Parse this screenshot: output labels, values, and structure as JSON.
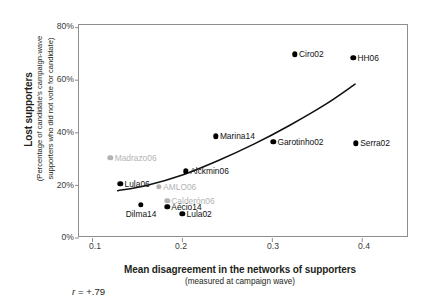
{
  "chart_data": {
    "type": "scatter",
    "title": "",
    "xlabel": "Mean disagreement in the networks of supporters",
    "xlabel_sub": "(measured at campaign wave)",
    "ylabel": "Lost supporters",
    "ylabel_sub_line1": "(Percentage of candidate's campaign-wave",
    "ylabel_sub_line2": "supporters who did not vote for candidate)",
    "xlim": [
      0.085,
      0.452
    ],
    "ylim": [
      0,
      81
    ],
    "xticks": [
      0.1,
      0.2,
      0.3,
      0.4
    ],
    "xtick_labels": [
      "0.1",
      "0.2",
      "0.3",
      "0.4"
    ],
    "yticks": [
      0,
      20,
      40,
      60,
      80
    ],
    "ytick_labels": [
      "0%",
      "20%",
      "40%",
      "60%",
      "80%"
    ],
    "grid": false,
    "legend": "none",
    "annotation": "r = +.79",
    "annotation_r": "r",
    "annotation_value": "= +.79",
    "trendline": {
      "type": "curve",
      "description": "fitted increasing curve",
      "points": [
        {
          "x": 0.128,
          "y": 18.0
        },
        {
          "x": 0.16,
          "y": 20.0
        },
        {
          "x": 0.2,
          "y": 24.0
        },
        {
          "x": 0.24,
          "y": 29.5
        },
        {
          "x": 0.28,
          "y": 35.8
        },
        {
          "x": 0.32,
          "y": 43.0
        },
        {
          "x": 0.36,
          "y": 51.0
        },
        {
          "x": 0.392,
          "y": 58.5
        }
      ]
    },
    "points": [
      {
        "label": "Ciro02",
        "x": 0.325,
        "y": 69.8,
        "color": "dark",
        "label_pos": "right"
      },
      {
        "label": "HH06",
        "x": 0.39,
        "y": 68.5,
        "color": "dark",
        "label_pos": "right"
      },
      {
        "label": "Marina14",
        "x": 0.237,
        "y": 38.6,
        "color": "dark",
        "label_pos": "right"
      },
      {
        "label": "Garotinho02",
        "x": 0.301,
        "y": 36.5,
        "color": "dark",
        "label_pos": "right"
      },
      {
        "label": "Serra02",
        "x": 0.393,
        "y": 36.0,
        "color": "dark",
        "label_pos": "right"
      },
      {
        "label": "Madrazo06",
        "x": 0.12,
        "y": 30.5,
        "color": "gray",
        "label_pos": "right"
      },
      {
        "label": "Alckmin06",
        "x": 0.204,
        "y": 25.3,
        "color": "dark",
        "label_pos": "right"
      },
      {
        "label": "Lula06",
        "x": 0.131,
        "y": 20.6,
        "color": "dark",
        "label_pos": "right"
      },
      {
        "label": "AMLO06",
        "x": 0.174,
        "y": 19.4,
        "color": "gray",
        "label_pos": "right"
      },
      {
        "label": "Calderón06",
        "x": 0.183,
        "y": 14.1,
        "color": "gray",
        "label_pos": "right"
      },
      {
        "label": "Dilma14",
        "x": 0.154,
        "y": 12.6,
        "color": "dark",
        "label_pos": "below"
      },
      {
        "label": "Aécio14",
        "x": 0.183,
        "y": 11.8,
        "color": "dark",
        "label_pos": "right"
      },
      {
        "label": "Lula02",
        "x": 0.2,
        "y": 9.1,
        "color": "dark",
        "label_pos": "right"
      }
    ]
  }
}
